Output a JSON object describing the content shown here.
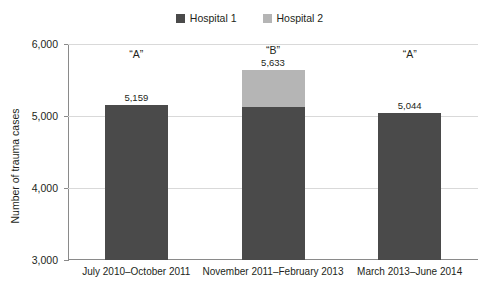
{
  "chart_data": {
    "type": "bar",
    "subtype": "stacked-bar",
    "title": "",
    "xlabel": "",
    "ylabel": "Number of trauma cases",
    "ylim": [
      3000,
      6000
    ],
    "yticks": [
      3000,
      4000,
      5000,
      6000
    ],
    "ytick_labels": [
      "3,000",
      "4,000",
      "5,000",
      "6,000"
    ],
    "grid": true,
    "legend_position": "top-center",
    "categories": [
      "July 2010–October 2011",
      "November 2011–February 2013",
      "March 2013–June 2014"
    ],
    "series": [
      {
        "name": "Hospital 1",
        "color": "#4a4a4a",
        "values": [
          5159,
          5125,
          5044
        ]
      },
      {
        "name": "Hospital 2",
        "color": "#b5b5b5",
        "values": [
          0,
          508,
          0
        ]
      }
    ],
    "totals": [
      5159,
      5633,
      5044
    ],
    "total_labels": [
      "5,159",
      "5,633",
      "5,044"
    ],
    "annotations": [
      "“A”",
      "“B”",
      "“A”"
    ]
  },
  "legend": {
    "items": [
      {
        "label": "Hospital 1",
        "color": "#4a4a4a"
      },
      {
        "label": "Hospital 2",
        "color": "#b5b5b5"
      }
    ]
  },
  "axes": {
    "y_title": "Number of trauma cases",
    "y_labels": [
      "6,000",
      "5,000",
      "4,000",
      "3,000"
    ],
    "x_labels": [
      "July 2010–October 2011",
      "November 2011–February 2013",
      "March 2013–June 2014"
    ]
  },
  "bars": [
    {
      "annotation": "“A”",
      "value_label": "5,159"
    },
    {
      "annotation": "“B”",
      "value_label": "5,633"
    },
    {
      "annotation": "“A”",
      "value_label": "5,044"
    }
  ]
}
